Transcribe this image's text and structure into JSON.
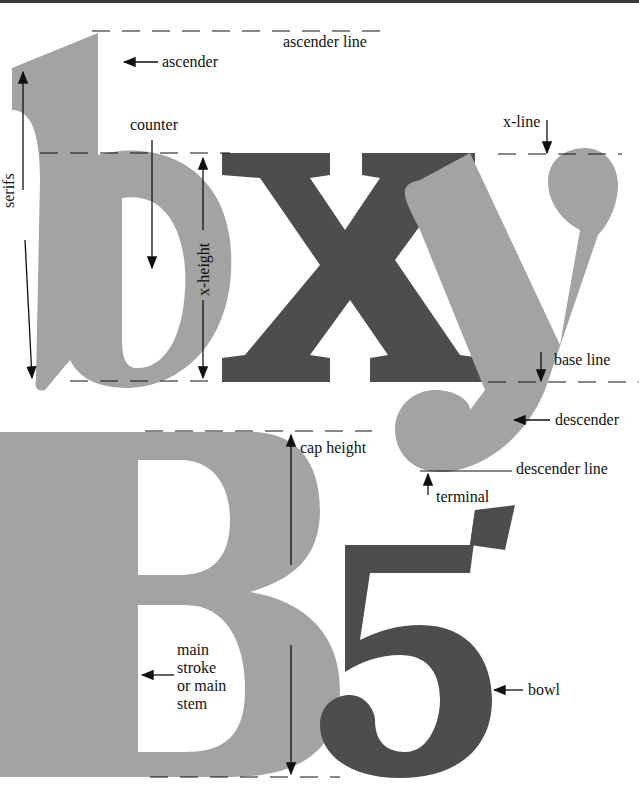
{
  "colors": {
    "light_glyph": "#a3a3a3",
    "dark_glyph": "#4d4d4d",
    "line": "#111111"
  },
  "glyphs": {
    "top": "bxy",
    "bottom": "B5"
  },
  "labels": {
    "ascender_line": "ascender line",
    "ascender": "ascender",
    "counter": "counter",
    "x_line": "x-line",
    "serifs": "serifs",
    "x_height": "x-height",
    "base_line": "base line",
    "descender": "descender",
    "descender_line": "descender line",
    "terminal": "terminal",
    "cap_height": "cap height",
    "main_stroke": "main stroke or main stem",
    "main_stroke_lines": [
      "main",
      "stroke",
      "or main",
      "stem"
    ],
    "bowl": "bowl"
  }
}
